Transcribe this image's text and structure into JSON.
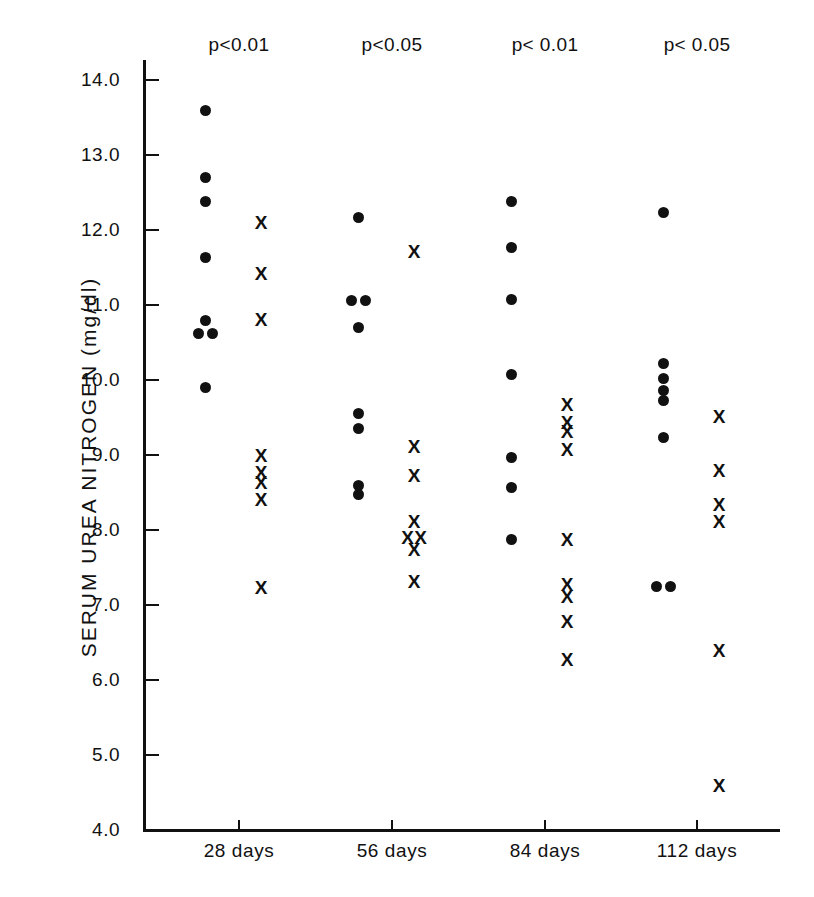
{
  "axes": {
    "ylabel": "SERUM UREA NITROGEN (mg/dl)",
    "yticks": [
      "14.0",
      "13.0",
      "12.0",
      "11.0",
      "10.0",
      "9.0",
      "8.0",
      "7.0",
      "6.0",
      "5.0",
      "4.0"
    ],
    "xticks": [
      "28 days",
      "56 days",
      "84 days",
      "112 days"
    ]
  },
  "annotations": [
    {
      "text": "p<0.01"
    },
    {
      "text": "p<0.05"
    },
    {
      "text": "p< 0.01"
    },
    {
      "text": "p< 0.05"
    }
  ],
  "chart_data": {
    "type": "scatter",
    "title": "",
    "xlabel": "",
    "ylabel": "SERUM UREA NITROGEN (mg/dl)",
    "ylim": [
      4.0,
      14.0
    ],
    "ytick_values": [
      14.0,
      13.0,
      12.0,
      11.0,
      10.0,
      9.0,
      8.0,
      7.0,
      6.0,
      5.0,
      4.0
    ],
    "categories": [
      "28 days",
      "56 days",
      "84 days",
      "112 days"
    ],
    "grid": false,
    "legend": null,
    "significance_labels": [
      "p<0.01",
      "p<0.05",
      "p< 0.01",
      "p< 0.05"
    ],
    "series": [
      {
        "name": "control",
        "marker": "filled-circle",
        "color": "#111111",
        "groups": [
          {
            "category": "28 days",
            "values": [
              13.6,
              12.7,
              12.38,
              11.64,
              10.8,
              10.62,
              10.62,
              9.9
            ]
          },
          {
            "category": "56 days",
            "values": [
              12.17,
              11.06,
              11.06,
              10.7,
              9.55,
              9.36,
              8.6,
              8.47
            ]
          },
          {
            "category": "84 days",
            "values": [
              12.38,
              11.77,
              11.08,
              10.08,
              8.97,
              8.57,
              7.88
            ]
          },
          {
            "category": "112 days",
            "values": [
              12.24,
              10.22,
              10.02,
              9.86,
              9.73,
              9.24,
              7.25,
              7.25
            ]
          }
        ]
      },
      {
        "name": "treated",
        "marker": "x",
        "color": "#111111",
        "groups": [
          {
            "category": "28 days",
            "values": [
              12.08,
              11.4,
              10.79,
              8.97,
              8.75,
              8.61,
              8.39,
              7.22
            ]
          },
          {
            "category": "56 days",
            "values": [
              11.69,
              9.1,
              8.71,
              8.1,
              7.88,
              7.88,
              7.72,
              7.3
            ]
          },
          {
            "category": "84 days",
            "values": [
              9.65,
              9.41,
              9.29,
              9.05,
              7.86,
              7.26,
              7.1,
              6.76,
              6.26
            ]
          },
          {
            "category": "112 days",
            "values": [
              9.5,
              8.78,
              8.32,
              8.1,
              6.37,
              4.58
            ]
          }
        ]
      }
    ]
  },
  "plot_geometry": {
    "x_left_px": 143,
    "x_right_px": 780,
    "y_top_px": 60,
    "y_baseline_px": 829,
    "value_top": 14.0,
    "value_top_px": 80,
    "value_bottom": 4.0,
    "value_bottom_px": 830,
    "group_centers_px": [
      239,
      392,
      545,
      697
    ],
    "dot_offset_px": -34,
    "x_offset_px": 22
  }
}
